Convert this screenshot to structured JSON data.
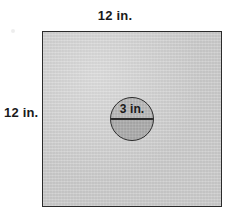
{
  "figure": {
    "type": "geometry-diagram",
    "square": {
      "name": "square",
      "side_label": "12 in.",
      "top_label": "12 in.",
      "left_label": "12 in.",
      "side_length_value": 12,
      "units": "in.",
      "fill_color": "#c9c9c9",
      "stroke_color": "#2b2b2b"
    },
    "circle": {
      "name": "circle",
      "label": "3 in.",
      "diameter_value": 3,
      "units": "in.",
      "fill_color": "#b4b4b4",
      "lower_half_fill_color": "#a8a8a8",
      "stroke_color": "#2b2b2b",
      "diameter_line": true
    },
    "background_color": "#ffffff",
    "text_color": "#1a1a1a"
  }
}
